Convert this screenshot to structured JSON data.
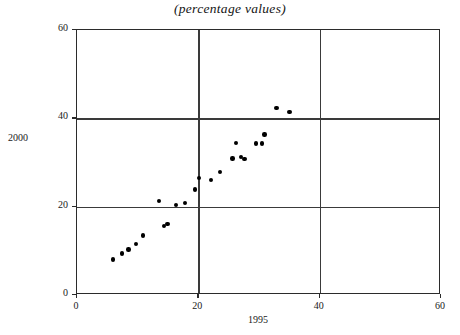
{
  "chart_data": {
    "type": "scatter",
    "title": "(percentage values)",
    "xlabel": "1995",
    "ylabel": "2000",
    "xlim": [
      0,
      60
    ],
    "ylim": [
      0,
      60
    ],
    "xticks": [
      0,
      20,
      40,
      60
    ],
    "yticks": [
      0,
      20,
      40,
      60
    ],
    "xticklabels": [
      "0",
      "20",
      "40",
      "60"
    ],
    "yticklabels": [
      "0",
      "20",
      "40",
      "60"
    ],
    "grid": true,
    "gridlines_x": [
      20,
      40
    ],
    "gridlines_y": [
      20,
      40
    ],
    "legend": null,
    "marker": "filled-circle",
    "marker_color": "#000000",
    "series": [
      {
        "name": "countries",
        "points": [
          {
            "x": 5.9,
            "y": 8.0
          },
          {
            "x": 7.4,
            "y": 9.4
          },
          {
            "x": 8.5,
            "y": 10.3
          },
          {
            "x": 9.7,
            "y": 11.6
          },
          {
            "x": 10.9,
            "y": 13.5
          },
          {
            "x": 14.3,
            "y": 15.6
          },
          {
            "x": 14.9,
            "y": 16.1
          },
          {
            "x": 13.5,
            "y": 21.3
          },
          {
            "x": 16.3,
            "y": 20.4
          },
          {
            "x": 17.8,
            "y": 20.8
          },
          {
            "x": 19.4,
            "y": 23.9
          },
          {
            "x": 20.1,
            "y": 26.5
          },
          {
            "x": 22.1,
            "y": 26.1
          },
          {
            "x": 23.6,
            "y": 27.8
          },
          {
            "x": 25.6,
            "y": 30.9
          },
          {
            "x": 26.2,
            "y": 34.4
          },
          {
            "x": 27.0,
            "y": 31.3
          },
          {
            "x": 27.6,
            "y": 30.8
          },
          {
            "x": 29.5,
            "y": 34.3
          },
          {
            "x": 30.5,
            "y": 34.3
          },
          {
            "x": 30.9,
            "y": 36.3
          },
          {
            "x": 32.9,
            "y": 42.3
          },
          {
            "x": 35.0,
            "y": 41.5
          }
        ]
      }
    ]
  }
}
